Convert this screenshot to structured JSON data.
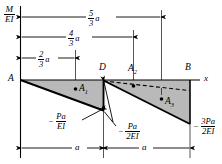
{
  "figure": {
    "type": "bending-moment-diagram",
    "axis": {
      "vertical_label_num": "M",
      "vertical_label_den": "EI",
      "horizontal_label": "x"
    },
    "points": {
      "a": "A",
      "d": "D",
      "b": "B"
    },
    "areas": {
      "a1": "A",
      "a1_sub": "1",
      "a2": "A",
      "a2_sub": "2",
      "a3": "A",
      "a3_sub": "3"
    },
    "dimensions_top": [
      {
        "name": "five-thirds-a",
        "num": "5",
        "den": "3",
        "unit": "a"
      },
      {
        "name": "four-thirds-a",
        "num": "4",
        "den": "3",
        "unit": "a"
      },
      {
        "name": "two-thirds-a",
        "num": "2",
        "den": "3",
        "unit": "a"
      }
    ],
    "dimensions_bottom": [
      {
        "name": "span-left",
        "label": "a"
      },
      {
        "name": "span-right",
        "label": "a"
      }
    ],
    "value_labels": [
      {
        "name": "moment-at-d-left",
        "sign": "−",
        "num": "Pa",
        "den": "EI"
      },
      {
        "name": "moment-at-d-right",
        "sign": "−",
        "num": "Pa",
        "den": "2EI"
      },
      {
        "name": "moment-at-b",
        "sign": "−",
        "num": "3Pa",
        "den": "2EI"
      }
    ],
    "colors": {
      "fill": "#b9b9b9",
      "stroke": "#000000",
      "thin": "#3a3a3a"
    }
  }
}
